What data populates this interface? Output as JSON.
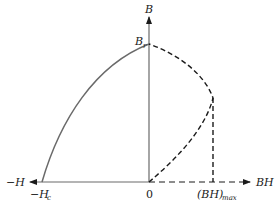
{
  "diagram": {
    "type": "demagnetization-curve-and-energy-product",
    "axes": {
      "vertical_label": "B",
      "horizontal_negative_label": "−H",
      "horizontal_positive_label": "BH",
      "origin_label": "0"
    },
    "points": {
      "remanence": {
        "label": "B",
        "subscript": "r"
      },
      "coercivity": {
        "label": "−H",
        "subscript": "c"
      },
      "max_energy": {
        "label": "(BH)",
        "subscript": "max"
      }
    },
    "curves": [
      {
        "name": "demagnetization-curve",
        "style": "solid",
        "from": "-Hc",
        "to": "Br"
      },
      {
        "name": "energy-product-curve",
        "style": "dashed",
        "from": "0",
        "through": "(BH)max",
        "to": "Br"
      },
      {
        "name": "bhmax-drop-line",
        "style": "dashed",
        "from": "(BH)max point",
        "to": "BH axis"
      }
    ],
    "colors": {
      "solid_curve": "#6a6a6a",
      "dashed_curve": "#1a1a1a",
      "axis": "#6a6a6a"
    }
  }
}
